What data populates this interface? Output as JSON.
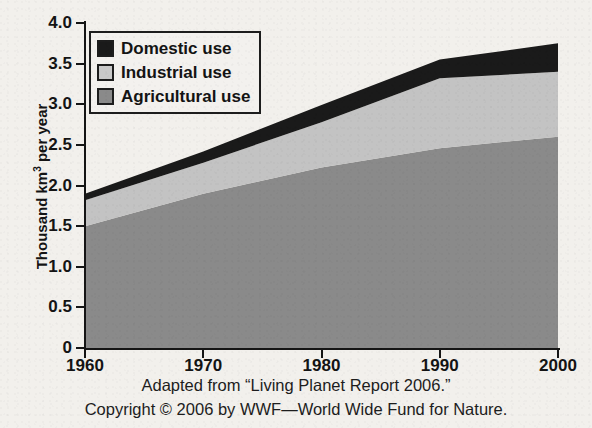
{
  "chart_data": {
    "type": "area",
    "title": "Global Water Use, 1960–2000",
    "xlabel": "",
    "ylabel": "Thousand km³ per year",
    "x": [
      1960,
      1970,
      1980,
      1990,
      2000
    ],
    "xtick_labels": [
      "1960",
      "1970",
      "1980",
      "1990",
      "2000"
    ],
    "xlim": [
      1960,
      2000
    ],
    "ylim": [
      0,
      4.0
    ],
    "ytick_labels": [
      "0",
      "0.5",
      "1.0",
      "1.5",
      "2.0",
      "2.5",
      "3.0",
      "3.5",
      "4.0"
    ],
    "ytick_values": [
      0,
      0.5,
      1.0,
      1.5,
      2.0,
      2.5,
      3.0,
      3.5,
      4.0
    ],
    "grid": false,
    "stacked": true,
    "legend_position": "upper-left-inside",
    "series": [
      {
        "name": "Agricultural use",
        "color": "#8a8a8a",
        "values": [
          1.5,
          1.9,
          2.22,
          2.46,
          2.6
        ]
      },
      {
        "name": "Industrial use",
        "color": "#c3c3c3",
        "values": [
          0.32,
          0.38,
          0.56,
          0.86,
          0.8
        ]
      },
      {
        "name": "Domestic use",
        "color": "#1a1a1a",
        "values": [
          0.08,
          0.14,
          0.21,
          0.23,
          0.35
        ]
      }
    ],
    "cumulative_tops": {
      "agricultural": [
        1.5,
        1.9,
        2.22,
        2.46,
        2.6
      ],
      "industrial": [
        1.82,
        2.28,
        2.78,
        3.32,
        3.4
      ],
      "domestic": [
        1.9,
        2.42,
        2.99,
        3.55,
        3.75
      ]
    },
    "annotations": []
  },
  "legend": {
    "items": [
      {
        "label": "Domestic use",
        "swatch_color": "#1a1a1a",
        "swatch_name": "domestic-use-swatch"
      },
      {
        "label": "Industrial use",
        "swatch_color": "#c9c9c9",
        "swatch_name": "industrial-use-swatch"
      },
      {
        "label": "Agricultural use",
        "swatch_color": "#8a8a8a",
        "swatch_name": "agricultural-use-swatch"
      }
    ]
  },
  "axes": {
    "y_title_main": "Thousand km",
    "y_title_sup": "3",
    "y_title_tail": " per year"
  },
  "captions": {
    "source": "Adapted from “Living Planet Report 2006.”",
    "copyright": "Copyright © 2006 by WWF—World Wide Fund for Nature."
  },
  "colors": {
    "background": "#f2f0ec",
    "axis": "#151515",
    "domestic": "#1a1a1a",
    "industrial": "#c3c3c3",
    "agricultural": "#8a8a8a"
  }
}
